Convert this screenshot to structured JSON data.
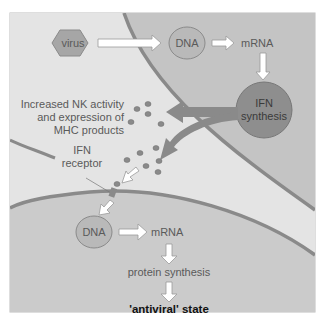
{
  "diagram": {
    "colors": {
      "frame_bg": "#cfcfcf",
      "infected_cell": "#bfbfbf",
      "extracellular": "#e3e3e3",
      "target_cell": "#c6c6c6",
      "membrane": "#8a8a8a",
      "nucleus_fill": "#b5b5b5",
      "ifn_fill": "#8e8e8e",
      "ifn_particle": "#8a8a8a",
      "white_arrow": "#ffffff",
      "dark_arrow": "#8a8a8a",
      "text": "#5a5a5a"
    },
    "infected_cell": {
      "virus": "virus",
      "dna": "DNA",
      "mrna": "mRNA",
      "ifn_synthesis_line1": "IFN",
      "ifn_synthesis_line2": "synthesis"
    },
    "extracellular": {
      "nk_line1": "Increased NK activity",
      "nk_line2": "and expression of",
      "nk_line3": "MHC products",
      "receptor_line1": "IFN",
      "receptor_line2": "receptor"
    },
    "target_cell": {
      "dna": "DNA",
      "mrna": "mRNA",
      "protein_synthesis": "protein synthesis",
      "antiviral_state": "'antiviral' state"
    }
  }
}
